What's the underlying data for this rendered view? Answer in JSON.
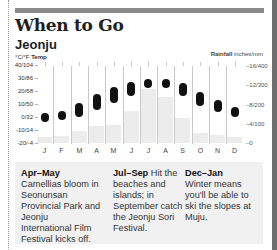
{
  "header": {
    "title": "When to Go",
    "subtitle": "Jeonju"
  },
  "axes": {
    "left_label_units": "°C/°F",
    "left_label_name": "Temp",
    "right_label_name": "Rainfall",
    "right_label_units": "inches/mm",
    "left_ticks": [
      "40/104 –",
      "30/86 –",
      "20/68 –",
      "10/50 –",
      "0/32 –",
      "-10/14 –",
      "-20/-4 –"
    ],
    "right_ticks": [
      "–16/400",
      "–12/300",
      "–8/200",
      "–4/100",
      "–0"
    ]
  },
  "months": [
    "J",
    "F",
    "M",
    "A",
    "M",
    "J",
    "J",
    "A",
    "S",
    "O",
    "N",
    "D"
  ],
  "colors": {
    "temp_oval": "#111111",
    "rain_bar": "#ececec",
    "notes_bg": "#f1f1f1",
    "top_bar": "#8a8a8a"
  },
  "notes": [
    {
      "period": "Apr–May",
      "text": " Camellias bloom in Seonunsan Provincial Park and Jeonju International Film Festival kicks off."
    },
    {
      "period": "Jul–Sep",
      "text": " Hit the beaches and islands; in September catch the Jeonju Sori Festival."
    },
    {
      "period": "Dec–Jan",
      "text": " Winter means you'll be able to ski the slopes at Muju."
    }
  ],
  "chart_data": {
    "type": "bar",
    "categories": [
      "Jan",
      "Feb",
      "Mar",
      "Apr",
      "May",
      "Jun",
      "Jul",
      "Aug",
      "Sep",
      "Oct",
      "Nov",
      "Dec"
    ],
    "series": [
      {
        "name": "Temp high (°C)",
        "values": [
          3,
          5,
          11,
          18,
          23,
          27,
          29,
          29,
          26,
          19,
          13,
          8
        ]
      },
      {
        "name": "Temp low (°C)",
        "values": [
          -4,
          -2,
          0,
          6,
          11,
          16,
          22,
          22,
          16,
          8,
          4,
          0
        ]
      },
      {
        "name": "Rainfall (mm)",
        "values": [
          30,
          35,
          60,
          90,
          95,
          165,
          280,
          240,
          130,
          50,
          40,
          30
        ]
      }
    ],
    "xlabel": "",
    "ylabel_left": "Temp °C/°F",
    "ylabel_right": "Rainfall inches/mm",
    "ylim_left": [
      -20,
      40
    ],
    "ylim_right": [
      0,
      400
    ],
    "grid": false,
    "legend": "none"
  }
}
